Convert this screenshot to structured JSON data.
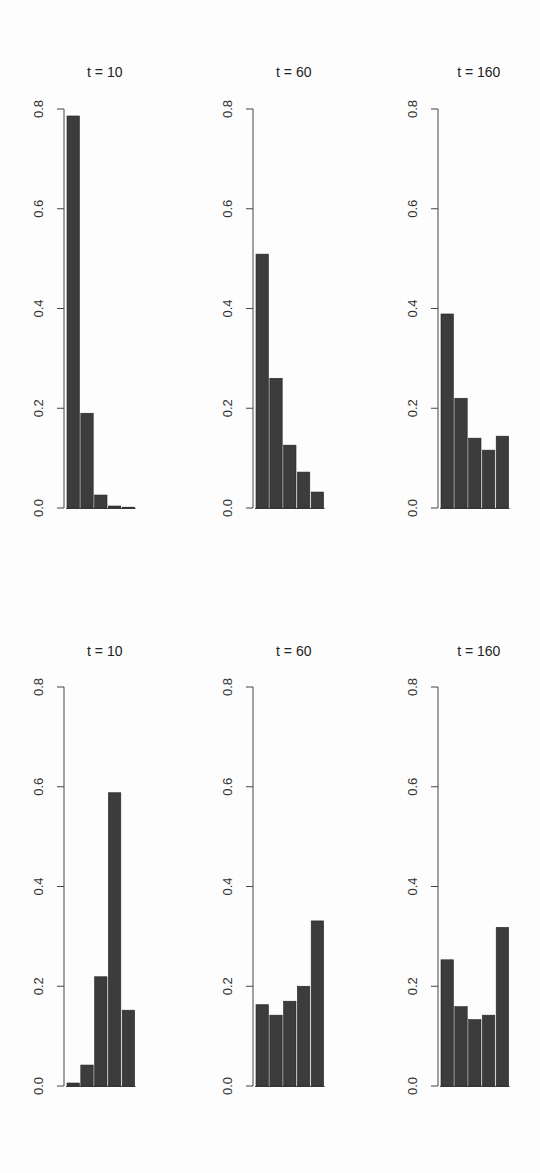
{
  "figure": {
    "width": 540,
    "height": 1173,
    "background": "#fdfdfd",
    "bar_color": "#3c3c3c",
    "axis_color": "#444444"
  },
  "chart_data": [
    {
      "type": "bar",
      "row": 1,
      "col": 1,
      "title": "t = 10",
      "categories": [
        "1",
        "2",
        "3",
        "4",
        "5"
      ],
      "values": [
        0.786,
        0.19,
        0.026,
        0.004,
        0.001
      ],
      "xlabel": "",
      "ylabel": "",
      "ylim": [
        0,
        0.8
      ],
      "yticks": [
        "0.0",
        "0.2",
        "0.4",
        "0.6",
        "0.8"
      ],
      "grid": false
    },
    {
      "type": "bar",
      "row": 1,
      "col": 2,
      "title": "t = 60",
      "categories": [
        "1",
        "2",
        "3",
        "4",
        "5"
      ],
      "values": [
        0.509,
        0.26,
        0.126,
        0.072,
        0.032
      ],
      "xlabel": "",
      "ylabel": "",
      "ylim": [
        0,
        0.8
      ],
      "yticks": [
        "0.0",
        "0.2",
        "0.4",
        "0.6",
        "0.8"
      ],
      "grid": false
    },
    {
      "type": "bar",
      "row": 1,
      "col": 3,
      "title": "t = 160",
      "categories": [
        "1",
        "2",
        "3",
        "4",
        "5"
      ],
      "values": [
        0.389,
        0.22,
        0.14,
        0.116,
        0.144
      ],
      "xlabel": "",
      "ylabel": "",
      "ylim": [
        0,
        0.8
      ],
      "yticks": [
        "0.0",
        "0.2",
        "0.4",
        "0.6",
        "0.8"
      ],
      "grid": false
    },
    {
      "type": "bar",
      "row": 2,
      "col": 1,
      "title": "t = 10",
      "categories": [
        "1",
        "2",
        "3",
        "4",
        "5"
      ],
      "values": [
        0.006,
        0.042,
        0.219,
        0.588,
        0.152
      ],
      "xlabel": "",
      "ylabel": "",
      "ylim": [
        0,
        0.8
      ],
      "yticks": [
        "0.0",
        "0.2",
        "0.4",
        "0.6",
        "0.8"
      ],
      "grid": false
    },
    {
      "type": "bar",
      "row": 2,
      "col": 2,
      "title": "t = 60",
      "categories": [
        "1",
        "2",
        "3",
        "4",
        "5"
      ],
      "values": [
        0.163,
        0.142,
        0.17,
        0.2,
        0.331
      ],
      "xlabel": "",
      "ylabel": "",
      "ylim": [
        0,
        0.8
      ],
      "yticks": [
        "0.0",
        "0.2",
        "0.4",
        "0.6",
        "0.8"
      ],
      "grid": false
    },
    {
      "type": "bar",
      "row": 2,
      "col": 3,
      "title": "t = 160",
      "categories": [
        "1",
        "2",
        "3",
        "4",
        "5"
      ],
      "values": [
        0.253,
        0.159,
        0.133,
        0.142,
        0.318
      ],
      "xlabel": "",
      "ylabel": "",
      "ylim": [
        0,
        0.8
      ],
      "yticks": [
        "0.0",
        "0.2",
        "0.4",
        "0.6",
        "0.8"
      ],
      "grid": false
    }
  ]
}
